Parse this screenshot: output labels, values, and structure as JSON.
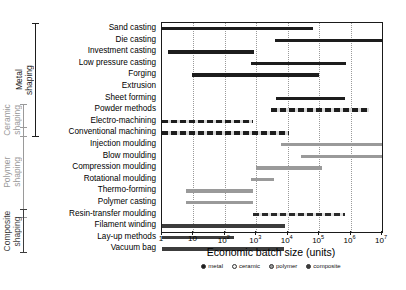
{
  "chart_data": {
    "type": "bar",
    "orientation": "horizontal",
    "title": "",
    "xlabel": "Economic batch size  (units)",
    "ylabel": "",
    "xscale": "log",
    "xlim": [
      1,
      10000000
    ],
    "xticks": [
      1,
      10,
      100,
      1000,
      10000,
      100000,
      1000000,
      10000000
    ],
    "xticklabels": [
      "1",
      "10",
      "10²",
      "10³",
      "10⁴",
      "10⁵",
      "10⁶",
      "10⁷"
    ],
    "grid": "vertical-dotted",
    "legend_position": "below-axis",
    "legend": [
      {
        "name": "metal",
        "color": "#1d1d1d",
        "style": "solid"
      },
      {
        "name": "ceramic",
        "color": "#f2f2f2",
        "style": "dashed"
      },
      {
        "name": "polymer",
        "color": "#9a9a9a",
        "style": "solid"
      },
      {
        "name": "composite",
        "color": "#3c3c3c",
        "style": "solid"
      }
    ],
    "categories": [
      "Sand casting",
      "Die casting",
      "Investment casting",
      "Low pressure casting",
      "Forging",
      "Extrusion",
      "Sheet forming",
      "Powder methods",
      "Electro-machining",
      "Conventional machining",
      "Injection moulding",
      "Blow moulding",
      "Compression moulding",
      "Rotational moulding",
      "Thermo-forming",
      "Polymer casting",
      "Resin-transfer moulding",
      "Filament winding",
      "Lay-up methods",
      "Vacuum bag"
    ],
    "ranges": [
      {
        "label": "Sand casting",
        "min": 1,
        "max": 63000,
        "material": "metal",
        "style": "solid"
      },
      {
        "label": "Die casting",
        "min": 3800,
        "max": 10000000,
        "material": "metal",
        "style": "solid"
      },
      {
        "label": "Investment casting",
        "min": 1.5,
        "max": 850,
        "material": "metal",
        "style": "solid"
      },
      {
        "label": "Low pressure casting",
        "min": 660,
        "max": 700000,
        "material": "metal",
        "style": "solid"
      },
      {
        "label": "Forging",
        "min": 9,
        "max": 100000,
        "material": "metal",
        "style": "solid"
      },
      {
        "label": "Extrusion",
        "min": null,
        "max": null,
        "material": "metal",
        "style": "none"
      },
      {
        "label": "Sheet forming",
        "min": 4200,
        "max": 650000,
        "material": "metal",
        "style": "solid"
      },
      {
        "label": "Powder methods",
        "min": 3000,
        "max": 4000000,
        "material": "ceramic",
        "style": "dashed"
      },
      {
        "label": "Electro-machining",
        "min": 1,
        "max": 800,
        "material": "ceramic",
        "style": "dashed"
      },
      {
        "label": "Conventional machining",
        "min": 1,
        "max": 11000,
        "material": "ceramic",
        "style": "dashed"
      },
      {
        "label": "Injection moulding",
        "min": 6000,
        "max": 10000000,
        "material": "polymer",
        "style": "solid"
      },
      {
        "label": "Blow moulding",
        "min": 27000,
        "max": 10000000,
        "material": "polymer",
        "style": "solid"
      },
      {
        "label": "Compression moulding",
        "min": 950,
        "max": 120000,
        "material": "polymer",
        "style": "solid"
      },
      {
        "label": "Rotational moulding",
        "min": 680,
        "max": 3600,
        "material": "polymer",
        "style": "solid"
      },
      {
        "label": "Thermo-forming",
        "min": 6,
        "max": 800,
        "material": "polymer",
        "style": "solid"
      },
      {
        "label": "Polymer casting",
        "min": 6,
        "max": 800,
        "material": "polymer",
        "style": "solid"
      },
      {
        "label": "Resin-transfer moulding",
        "min": 800,
        "max": 650000,
        "material": "composite",
        "style": "dashed"
      },
      {
        "label": "Filament winding",
        "min": 1,
        "max": 8500,
        "material": "composite",
        "style": "solid"
      },
      {
        "label": "Lay-up methods",
        "min": 1,
        "max": 200,
        "material": "composite",
        "style": "solid"
      },
      {
        "label": "Vacuum bag",
        "min": 1,
        "max": 7500,
        "material": "composite",
        "style": "solid"
      }
    ],
    "groups": [
      {
        "label": "Metal\nshaping",
        "first": "Sand casting",
        "last": "Conventional machining",
        "color": "#1d1d1d"
      },
      {
        "label": "Ceramic\nshaping",
        "first": "Powder methods",
        "last": "Conventional machining",
        "color": "#9a9a9a"
      },
      {
        "label": "Polymer\nshaping",
        "first": "Conventional machining",
        "last": "Resin-transfer moulding",
        "color": "#9a9a9a"
      },
      {
        "label": "Composite\nshaping",
        "first": "Resin-transfer moulding",
        "last": "Vacuum bag",
        "color": "#3c3c3c"
      }
    ]
  }
}
